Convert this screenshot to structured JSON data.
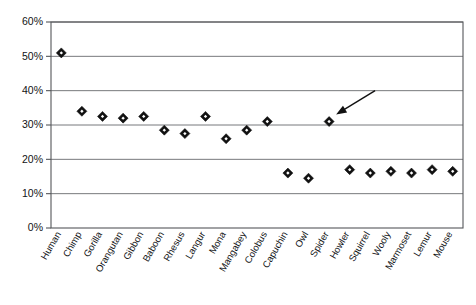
{
  "chart_data": {
    "type": "scatter",
    "title": "",
    "subtitle": "",
    "xlabel": "",
    "ylabel": "",
    "ylim": [
      0,
      60
    ],
    "y_tick_labels": [
      "0%",
      "10%",
      "20%",
      "30%",
      "40%",
      "50%",
      "60%"
    ],
    "y_ticks": [
      0,
      10,
      20,
      30,
      40,
      50,
      60
    ],
    "grid": "horizontal",
    "legend": "none",
    "categories": [
      "Human",
      "Chimp",
      "Gorilla",
      "Orangutan",
      "Gibbon",
      "Baboon",
      "Rhesus",
      "Langur",
      "Mona",
      "Mangabey",
      "Colobus",
      "Capuchin",
      "Owl",
      "Spider",
      "Howler",
      "Squirrel",
      "Wooly",
      "Marmoset",
      "Lemur",
      "Mouse"
    ],
    "values": [
      51,
      34,
      32.5,
      32,
      32.5,
      28.5,
      27.5,
      32.5,
      26,
      28.5,
      31,
      16,
      14.5,
      31,
      17,
      16,
      16.5,
      16,
      17,
      16.5
    ],
    "annotations": [
      {
        "type": "arrow",
        "target_category": "Spider",
        "target_value": 31,
        "label": ""
      }
    ],
    "marker": {
      "shape": "diamond",
      "fill": "#111111",
      "inner_fill": "#ffffff"
    },
    "colors": {
      "axis": "#55575a",
      "grid": "#77797c",
      "marker": "#111111",
      "background": "#ffffff",
      "text": "#111315"
    },
    "plot_area": {
      "left": 51,
      "top": 22,
      "right": 463,
      "bottom": 228
    }
  }
}
